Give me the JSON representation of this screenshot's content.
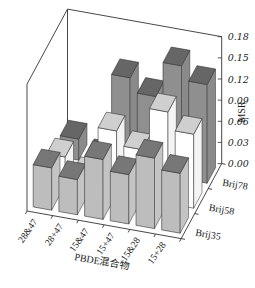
{
  "chart_data": {
    "type": "bar3d",
    "title": "",
    "xlabel": "PBDE混合物",
    "ylabel": "",
    "zlabel": "MSR",
    "categories": [
      "28&47",
      "28+47",
      "15&47",
      "15+47",
      "15&28",
      "15+28"
    ],
    "rows": [
      "Brij35",
      "Brij58",
      "Brij78"
    ],
    "zlim": [
      0,
      0.18
    ],
    "zticks": [
      "0.00",
      "0.03",
      "0.06",
      "0.09",
      "0.12",
      "0.15",
      "0.18"
    ],
    "series": [
      {
        "name": "Brij35",
        "values": [
          0.06,
          0.05,
          0.085,
          0.07,
          0.1,
          0.085
        ],
        "side_color": "#c4c4c4",
        "top_color": "#777777",
        "front_color": "#bdbdbd"
      },
      {
        "name": "Brij58",
        "values": [
          0.04,
          0.02,
          0.09,
          0.07,
          0.13,
          0.105
        ],
        "side_color": "#f4f4f4",
        "top_color": "#cfcfcf",
        "front_color": "#ffffff"
      },
      {
        "name": "Brij78",
        "values": [
          0.03,
          0.01,
          0.13,
          0.11,
          0.16,
          0.14
        ],
        "side_color": "#8a8a8a",
        "top_color": "#666666",
        "front_color": "#8f8f8f"
      }
    ],
    "grid": false,
    "legend": "none"
  }
}
